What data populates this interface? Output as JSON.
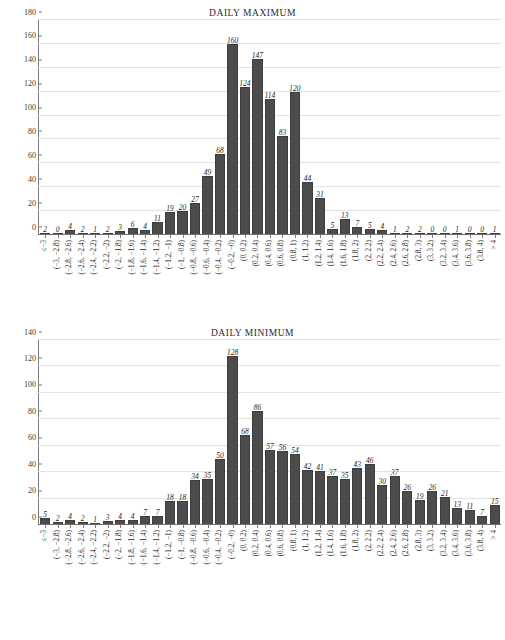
{
  "figure": {
    "categories": [
      "≤−3",
      "(−3, −2.8)",
      "(−2.8, −2.6)",
      "(−2.6, −2.4)",
      "(−2.4, −2.2)",
      "(−2.2, −2)",
      "(−2, −1.8)",
      "(−1.8, −1.6)",
      "(−1.6, −1.4)",
      "(−1.4, −1.2)",
      "(−1.2, −1)",
      "(−1, −0.8)",
      "(−0.8, −0.6)",
      "(−0.6, −0.4)",
      "(−0.4, −0.2)",
      "(−0.2, −0)",
      "(0, 0.2)",
      "(0.2, 0.4)",
      "(0.4, 0.6)",
      "(0.6, 0.8)",
      "(0.8, 1)",
      "(1, 1.2)",
      "(1.2, 1.4)",
      "(1.4, 1.6)",
      "(1.6, 1.8)",
      "(1.8, 2)",
      "(2, 2.2)",
      "(2.2, 2.4)",
      "(2.4, 2.6)",
      "(2.6, 2.8)",
      "(2.8, 3)",
      "(3, 3.2)",
      "(3.2, 3.4)",
      "(3.4, 3.6)",
      "(3.6, 3.8)",
      "(3.8, 4)",
      "> 4"
    ]
  },
  "chart_data": [
    {
      "type": "bar",
      "title": "DAILY MAXIMUM",
      "xlabel": "",
      "ylabel": "",
      "ylim": [
        0,
        180
      ],
      "yticks": [
        0,
        20,
        40,
        60,
        80,
        100,
        120,
        140,
        160,
        180
      ],
      "grid": true,
      "legend": "none",
      "bar_color": "#4c4c4c",
      "categories": [
        "≤−3",
        "(−3, −2.8)",
        "(−2.8, −2.6)",
        "(−2.6, −2.4)",
        "(−2.4, −2.2)",
        "(−2.2, −2)",
        "(−2, −1.8)",
        "(−1.8, −1.6)",
        "(−1.6, −1.4)",
        "(−1.4, −1.2)",
        "(−1.2, −1)",
        "(−1, −0.8)",
        "(−0.8, −0.6)",
        "(−0.6, −0.4)",
        "(−0.4, −0.2)",
        "(−0.2, −0)",
        "(0, 0.2)",
        "(0.2, 0.4)",
        "(0.4, 0.6)",
        "(0.6, 0.8)",
        "(0.8, 1)",
        "(1, 1.2)",
        "(1.2, 1.4)",
        "(1.4, 1.6)",
        "(1.6, 1.8)",
        "(1.8, 2)",
        "(2, 2.2)",
        "(2.2, 2.4)",
        "(2.4, 2.6)",
        "(2.6, 2.8)",
        "(2.8, 3)",
        "(3, 3.2)",
        "(3.2, 3.4)",
        "(3.4, 3.6)",
        "(3.6, 3.8)",
        "(3.8, 4)",
        "> 4"
      ],
      "values": [
        2,
        0,
        4,
        2,
        1,
        2,
        3,
        6,
        4,
        11,
        19,
        20,
        27,
        49,
        68,
        160,
        124,
        147,
        114,
        83,
        120,
        44,
        31,
        5,
        13,
        7,
        5,
        4,
        1,
        2,
        2,
        0,
        0,
        1,
        0,
        0,
        1
      ]
    },
    {
      "type": "bar",
      "title": "DAILY MINIMUM",
      "xlabel": "",
      "ylabel": "",
      "ylim": [
        0,
        140
      ],
      "yticks": [
        0,
        20,
        40,
        60,
        80,
        100,
        120,
        140
      ],
      "grid": true,
      "legend": "none",
      "bar_color": "#4c4c4c",
      "categories": [
        "≤−3",
        "(−3, −2.8)",
        "(−2.8, −2.6)",
        "(−2.6, −2.4)",
        "(−2.4, −2.2)",
        "(−2.2, −2)",
        "(−2, −1.8)",
        "(−1.8, −1.6)",
        "(−1.6, −1.4)",
        "(−1.4, −1.2)",
        "(−1.2, −1)",
        "(−1, −0.8)",
        "(−0.8, −0.6)",
        "(−0.6, −0.4)",
        "(−0.4, −0.2)",
        "(−0.2, −0)",
        "(0, 0.2)",
        "(0.2, 0.4)",
        "(0.4, 0.6)",
        "(0.6, 0.8)",
        "(0.8, 1)",
        "(1, 1.2)",
        "(1.2, 1.4)",
        "(1.4, 1.6)",
        "(1.6, 1.8)",
        "(1.8, 2)",
        "(2, 2.2)",
        "(2.2, 2.4)",
        "(2.4, 2.6)",
        "(2.6, 2.8)",
        "(2.8, 3)",
        "(3, 3.2)",
        "(3.2, 3.4)",
        "(3.4, 3.6)",
        "(3.6, 3.8)",
        "(3.8, 4)",
        "> 4"
      ],
      "values": [
        5,
        2,
        4,
        2,
        1,
        3,
        4,
        4,
        7,
        7,
        18,
        18,
        34,
        35,
        50,
        128,
        68,
        86,
        57,
        56,
        54,
        42,
        41,
        37,
        35,
        43,
        46,
        30,
        37,
        26,
        19,
        26,
        21,
        13,
        11,
        7,
        15
      ]
    }
  ]
}
